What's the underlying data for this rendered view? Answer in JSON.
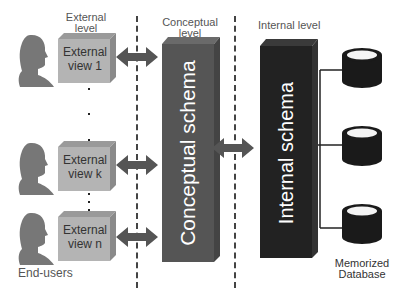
{
  "levels": {
    "external": "External level",
    "external_line1": "External",
    "external_line2": "level",
    "conceptual_line1": "Conceptual",
    "conceptual_line2": "level",
    "internal": "Internal level"
  },
  "external_views": [
    {
      "line1": "External",
      "line2": "view 1"
    },
    {
      "line1": "External",
      "line2": "view k"
    },
    {
      "line1": "External",
      "line2": "view n"
    }
  ],
  "end_users_label": "End-users",
  "conceptual_schema": "Conceptual schema",
  "internal_schema": "Internal schema",
  "database_label_line1": "Memorized",
  "database_label_line2": "Database",
  "colors": {
    "external_box": "#b4b4b4",
    "conceptual_block": "#555555",
    "internal_block": "#222222",
    "arrow": "#555555",
    "person": "#777777",
    "database": "#1a1a1a"
  }
}
